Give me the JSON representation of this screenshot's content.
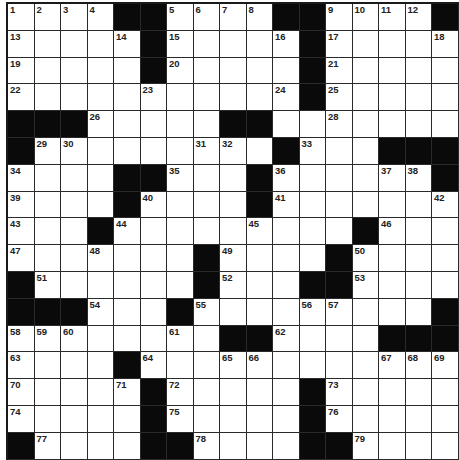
{
  "puzzle": {
    "cols": 17,
    "rows": 17,
    "colors": {
      "black": "#0a0a0a",
      "white": "#ffffff",
      "line": "#2a2a2a"
    },
    "grid": [
      "....##....##....#",
      ".....#.....#.....",
      ".....#.....#.....",
      "...........#.....",
      "###.....##.......",
      "#.........#...###",
      "....##...#......#",
      "....#....#.......",
      "...#.........#...",
      ".......#....#....",
      "#......#...##....",
      "###...#.........#",
      "........##....###",
      "....#............",
      ".....#.....#.....",
      ".....#.....#.....",
      "#....##....##...."
    ],
    "numbers": [
      [
        1,
        0,
        0
      ],
      [
        2,
        0,
        1
      ],
      [
        3,
        0,
        2
      ],
      [
        4,
        0,
        3
      ],
      [
        5,
        0,
        6
      ],
      [
        6,
        0,
        7
      ],
      [
        7,
        0,
        8
      ],
      [
        8,
        0,
        9
      ],
      [
        9,
        0,
        12
      ],
      [
        10,
        0,
        13
      ],
      [
        11,
        0,
        14
      ],
      [
        12,
        0,
        15
      ],
      [
        13,
        1,
        0
      ],
      [
        14,
        1,
        4
      ],
      [
        15,
        1,
        6
      ],
      [
        16,
        1,
        10
      ],
      [
        17,
        1,
        12
      ],
      [
        18,
        1,
        16
      ],
      [
        19,
        2,
        0
      ],
      [
        20,
        2,
        6
      ],
      [
        21,
        2,
        12
      ],
      [
        22,
        3,
        0
      ],
      [
        23,
        3,
        5
      ],
      [
        24,
        3,
        10
      ],
      [
        25,
        3,
        12
      ],
      [
        26,
        4,
        3
      ],
      [
        27,
        4,
        9
      ],
      [
        28,
        4,
        12
      ],
      [
        29,
        5,
        1
      ],
      [
        30,
        5,
        2
      ],
      [
        31,
        5,
        7
      ],
      [
        32,
        5,
        8
      ],
      [
        33,
        5,
        11
      ],
      [
        34,
        6,
        0
      ],
      [
        35,
        6,
        6
      ],
      [
        36,
        6,
        10
      ],
      [
        37,
        6,
        14
      ],
      [
        38,
        6,
        15
      ],
      [
        39,
        7,
        0
      ],
      [
        40,
        7,
        5
      ],
      [
        41,
        7,
        10
      ],
      [
        42,
        7,
        16
      ],
      [
        43,
        8,
        0
      ],
      [
        44,
        8,
        4
      ],
      [
        45,
        8,
        9
      ],
      [
        46,
        8,
        14
      ],
      [
        47,
        9,
        0
      ],
      [
        48,
        9,
        3
      ],
      [
        49,
        9,
        8
      ],
      [
        50,
        9,
        13
      ],
      [
        51,
        10,
        1
      ],
      [
        52,
        10,
        8
      ],
      [
        53,
        10,
        13
      ],
      [
        54,
        11,
        3
      ],
      [
        55,
        11,
        7
      ],
      [
        56,
        11,
        11
      ],
      [
        57,
        11,
        12
      ],
      [
        58,
        12,
        0
      ],
      [
        59,
        12,
        1
      ],
      [
        60,
        12,
        2
      ],
      [
        61,
        12,
        6
      ],
      [
        62,
        12,
        10
      ],
      [
        63,
        13,
        0
      ],
      [
        64,
        13,
        5
      ],
      [
        65,
        13,
        8
      ],
      [
        66,
        13,
        9
      ],
      [
        67,
        13,
        14
      ],
      [
        68,
        13,
        15
      ],
      [
        69,
        13,
        16
      ],
      [
        70,
        14,
        0
      ],
      [
        71,
        14,
        4
      ],
      [
        72,
        14,
        6
      ],
      [
        73,
        14,
        12
      ],
      [
        74,
        15,
        0
      ],
      [
        75,
        15,
        6
      ],
      [
        76,
        15,
        12
      ],
      [
        77,
        16,
        1
      ],
      [
        78,
        16,
        7
      ],
      [
        79,
        16,
        13
      ]
    ]
  }
}
